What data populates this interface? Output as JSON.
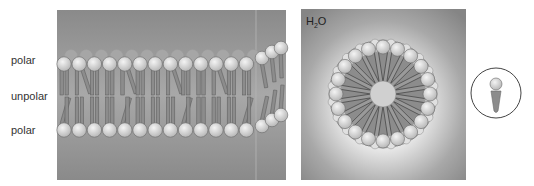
{
  "diagram": {
    "bilayer_panel": {
      "labels": {
        "top": "polar",
        "middle": "unpolar",
        "bottom": "polar"
      },
      "lipids_per_leaflet": 13
    },
    "micelle_panel": {
      "solvent_label": "H",
      "solvent_sub": "2",
      "solvent_suffix": "O",
      "lipid_count": 20
    },
    "inset": {
      "description": "single lipid molecule"
    },
    "colors": {
      "panel_bg": "#8a8a8a",
      "panel_glow": "#d8d8d8",
      "head": "#dcdcdc",
      "head_stroke": "#6a6a6a",
      "tail": "#8c8c8c",
      "tail_stroke": "#5a5a5a",
      "circle_stroke": "#444444"
    }
  }
}
